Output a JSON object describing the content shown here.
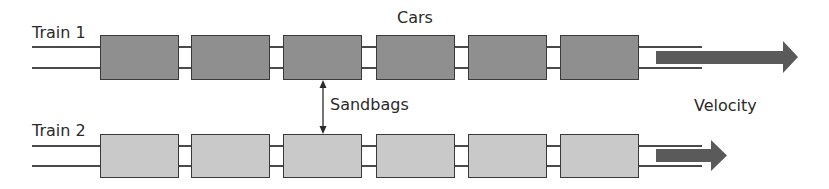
{
  "diagram": {
    "labels": {
      "train1": "Train 1",
      "train2": "Train 2",
      "cars": "Cars",
      "sandbags": "Sandbags",
      "velocity": "Velocity"
    },
    "colors": {
      "train1_car_fill": "#8f8f8f",
      "train2_car_fill": "#c9c9c9",
      "car_border": "#3a3a3a",
      "rail": "#4a4a4a",
      "velocity_arrow": "#5a5a5a",
      "text": "#2a2a2a"
    },
    "trains": [
      {
        "name": "Train 1",
        "car_count": 6,
        "velocity_arrow_length": "long"
      },
      {
        "name": "Train 2",
        "car_count": 6,
        "velocity_arrow_length": "short"
      }
    ],
    "annotations": [
      {
        "text": "Cars",
        "points_to": "train 1 cars"
      },
      {
        "text": "Sandbags",
        "points_to": "gap between train 1 car 3 and train 2 car 3 (double-headed arrow)"
      },
      {
        "text": "Velocity",
        "points_to": "velocity arrows of both trains"
      }
    ]
  }
}
